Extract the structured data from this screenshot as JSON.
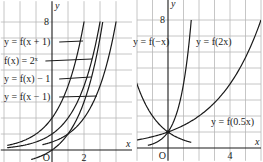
{
  "panels": [
    {
      "id": "left",
      "origin_px": [
        52,
        150
      ],
      "unit_px": [
        16,
        16
      ],
      "x_range": [
        -3.2,
        5.0
      ],
      "y_range": [
        -0.8,
        9.3
      ],
      "grid_x": [
        -3,
        -2,
        -1,
        1,
        2,
        3,
        4
      ],
      "grid_y": [
        1,
        2,
        3,
        4,
        5,
        6,
        7,
        8
      ],
      "axis_x_label": "x",
      "axis_y_label": "y",
      "origin_label": "O",
      "tick_labels": [
        {
          "text": "8",
          "axis": "y",
          "value": 8
        },
        {
          "text": "2",
          "axis": "x",
          "value": 2
        }
      ],
      "curves": [
        {
          "name": "y = f(x + 1)",
          "fn": "2^(x+1)",
          "x_from": -2.8,
          "x_to": 2.2
        },
        {
          "name": "f(x) = 2^x",
          "fn": "2^x",
          "x_from": -2.8,
          "x_to": 3.2
        },
        {
          "name": "y = f(x) - 1",
          "fn": "2^x-1",
          "x_from": -1.3,
          "x_to": 3.17
        },
        {
          "name": "y = f(x - 1)",
          "fn": "2^(x-1)",
          "x_from": -0.6,
          "x_to": 4.2
        }
      ],
      "labels": [
        {
          "text": "y = f(x + 1)",
          "x": 4,
          "y": 45,
          "leader_to": [
            83,
            41
          ]
        },
        {
          "text": "f(x) = 2ˣ",
          "x": 4,
          "y": 64,
          "leader_to": [
            92,
            59
          ]
        },
        {
          "text": "y = f(x) − 1",
          "x": 4,
          "y": 82,
          "leader_to": [
            91,
            77
          ]
        },
        {
          "text": "y = f(x − 1)",
          "x": 4,
          "y": 100,
          "leader_to": [
            97,
            96
          ]
        }
      ]
    },
    {
      "id": "right",
      "origin_px": [
        168,
        148
      ],
      "unit_px": [
        15.5,
        16
      ],
      "x_range": [
        -2.0,
        6.0
      ],
      "y_range": [
        -0.8,
        9.3
      ],
      "grid_x": [
        -2,
        -1,
        1,
        2,
        3,
        4,
        5,
        6
      ],
      "grid_y": [
        1,
        2,
        3,
        4,
        5,
        6,
        7,
        8
      ],
      "axis_x_label": "x",
      "axis_y_label": "y",
      "origin_label": "O",
      "tick_labels": [
        {
          "text": "8",
          "axis": "y",
          "value": 8
        },
        {
          "text": "4",
          "axis": "x",
          "value": 4
        }
      ],
      "curves": [
        {
          "name": "y = f(-x)",
          "fn": "2^(-x)",
          "x_from": -2.05,
          "x_to": 1.5
        },
        {
          "name": "y = f(2x)",
          "fn": "4^x",
          "x_from": -1.3,
          "x_to": 1.5
        },
        {
          "name": "y = f(0.5x)",
          "fn": "2^(0.5x)",
          "x_from": -3.0,
          "x_to": 6.0
        }
      ],
      "labels": [
        {
          "text": "y = f(−x)",
          "x": 133,
          "y": 45
        },
        {
          "text": "y = f(2x)",
          "x": 196,
          "y": 45
        },
        {
          "text": "y = f(0.5x)",
          "x": 211,
          "y": 125
        }
      ],
      "marked_point": {
        "x": 0,
        "y": 1
      }
    }
  ]
}
